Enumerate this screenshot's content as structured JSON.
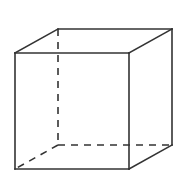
{
  "diagram": {
    "type": "wireframe-cube",
    "stroke_color": "#333333",
    "background": "#ffffff",
    "vertices": {
      "front_top_left": [
        15,
        53
      ],
      "front_top_right": [
        129,
        53
      ],
      "front_bottom_left": [
        15,
        169
      ],
      "front_bottom_right": [
        129,
        169
      ],
      "back_top_left": [
        58,
        29
      ],
      "back_top_right": [
        172,
        29
      ],
      "back_bottom_left": [
        58,
        145
      ],
      "back_bottom_right": [
        172,
        145
      ]
    },
    "visible_edges": [
      [
        "front_top_left",
        "front_top_right"
      ],
      [
        "front_top_right",
        "front_bottom_right"
      ],
      [
        "front_bottom_right",
        "front_bottom_left"
      ],
      [
        "front_bottom_left",
        "front_top_left"
      ],
      [
        "front_top_left",
        "back_top_left"
      ],
      [
        "back_top_left",
        "back_top_right"
      ],
      [
        "front_top_right",
        "back_top_right"
      ],
      [
        "back_top_right",
        "back_bottom_right"
      ],
      [
        "front_bottom_right",
        "back_bottom_right"
      ]
    ],
    "hidden_edges": [
      [
        "back_top_left",
        "back_bottom_left"
      ],
      [
        "back_bottom_left",
        "back_bottom_right"
      ],
      [
        "back_bottom_left",
        "front_bottom_left"
      ]
    ]
  }
}
